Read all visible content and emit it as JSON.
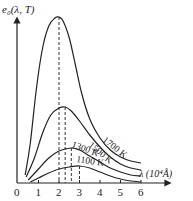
{
  "chart_data": {
    "type": "line",
    "title": "",
    "ylabel": "e0(λ, T)",
    "xlabel": "λ (10⁴Å)",
    "x_ticks": [
      "0",
      "1",
      "2",
      "3",
      "4",
      "5",
      "6"
    ],
    "xlim": [
      0,
      7.2
    ],
    "grid": false,
    "legend": "inline labels on curves",
    "series": [
      {
        "name": "1700 K",
        "peak_lambda": 2.0,
        "peak_value": 166,
        "points": [
          [
            0.35,
            8
          ],
          [
            0.6,
            40
          ],
          [
            0.9,
            95
          ],
          [
            1.2,
            135
          ],
          [
            1.5,
            157
          ],
          [
            1.8,
            165
          ],
          [
            2.0,
            166
          ],
          [
            2.2,
            162
          ],
          [
            2.5,
            145
          ],
          [
            2.8,
            118
          ],
          [
            3.1,
            90
          ],
          [
            3.5,
            64
          ],
          [
            4.0,
            45
          ],
          [
            4.5,
            33
          ],
          [
            5.0,
            26
          ],
          [
            5.5,
            22
          ],
          [
            6.0,
            20
          ]
        ]
      },
      {
        "name": "1500 K",
        "peak_lambda": 2.3,
        "peak_value": 76,
        "points": [
          [
            0.4,
            6
          ],
          [
            0.8,
            25
          ],
          [
            1.2,
            50
          ],
          [
            1.6,
            68
          ],
          [
            2.0,
            75
          ],
          [
            2.3,
            76
          ],
          [
            2.6,
            72
          ],
          [
            3.0,
            62
          ],
          [
            3.5,
            48
          ],
          [
            4.0,
            36
          ],
          [
            4.5,
            26
          ],
          [
            5.0,
            19
          ],
          [
            5.5,
            15
          ],
          [
            6.0,
            13
          ]
        ]
      },
      {
        "name": "1300 K",
        "peak_lambda": 2.6,
        "peak_value": 35,
        "points": [
          [
            0.5,
            3
          ],
          [
            1.0,
            14
          ],
          [
            1.5,
            25
          ],
          [
            2.0,
            32
          ],
          [
            2.6,
            35
          ],
          [
            3.0,
            33
          ],
          [
            3.5,
            27
          ],
          [
            4.0,
            21
          ],
          [
            4.5,
            15
          ],
          [
            5.0,
            11
          ],
          [
            5.5,
            8
          ],
          [
            6.0,
            7
          ]
        ]
      },
      {
        "name": "1100 K",
        "peak_lambda": 3.0,
        "peak_value": 17,
        "points": [
          [
            0.6,
            1
          ],
          [
            1.0,
            5
          ],
          [
            1.5,
            10
          ],
          [
            2.0,
            14
          ],
          [
            2.5,
            16
          ],
          [
            3.0,
            17
          ],
          [
            3.5,
            15
          ],
          [
            4.0,
            11
          ],
          [
            4.5,
            7
          ],
          [
            5.0,
            4
          ],
          [
            5.5,
            2
          ],
          [
            6.0,
            1
          ]
        ]
      }
    ],
    "dashed_peak_lines_at": [
      2.0,
      2.3,
      2.6,
      3.0
    ],
    "labels": {
      "y_axis": "e₀(λ, T)",
      "x_axis": "λ (10⁴Å)",
      "curves": [
        "1700 K",
        "1500 K",
        "1300 K",
        "1100 K"
      ]
    }
  }
}
